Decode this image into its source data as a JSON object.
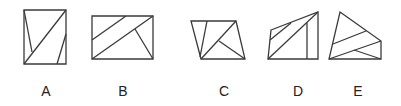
{
  "figure": {
    "type": "multiple-choice-shape-options",
    "options": [
      {
        "label": "A",
        "description": "Rectangle divided by three line segments"
      },
      {
        "label": "B",
        "description": "Rectangle divided by three line segments"
      },
      {
        "label": "C",
        "description": "Quadrilateral divided by three line segments"
      },
      {
        "label": "D",
        "description": "Pentagon divided by three line segments"
      },
      {
        "label": "E",
        "description": "Quadrilateral divided by three line segments"
      }
    ]
  }
}
